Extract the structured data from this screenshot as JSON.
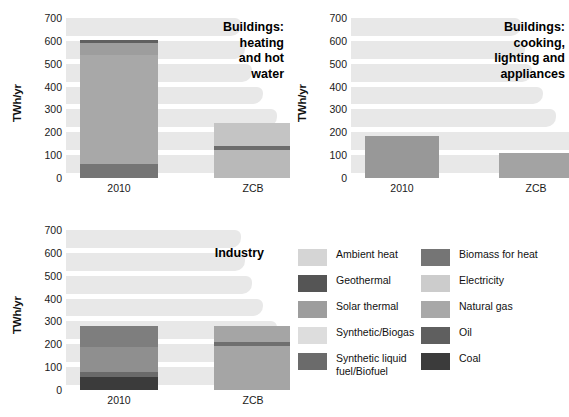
{
  "axis": {
    "ylabel": "TWh/yr",
    "yticks": [
      700,
      600,
      500,
      400,
      300,
      200,
      100,
      0
    ],
    "ymax": 700,
    "ymin": 0
  },
  "categories": [
    "2010",
    "ZCB"
  ],
  "legend": {
    "left": [
      {
        "label": "Ambient heat",
        "color": "#d5d5d5"
      },
      {
        "label": "Geothermal",
        "color": "#555555"
      },
      {
        "label": "Solar thermal",
        "color": "#9d9d9d"
      },
      {
        "label": "Synthetic/Biogas",
        "color": "#dddddd"
      },
      {
        "label": "Synthetic liquid\nfuel/Biofuel",
        "color": "#6b6b6b"
      }
    ],
    "right": [
      {
        "label": "Biomass for heat",
        "color": "#757575"
      },
      {
        "label": "Electricity",
        "color": "#cccccc"
      },
      {
        "label": "Natural gas",
        "color": "#a8a8a8"
      },
      {
        "label": "Oil",
        "color": "#5f5f5f"
      },
      {
        "label": "Coal",
        "color": "#3b3b3b"
      }
    ]
  },
  "chart_data": [
    {
      "type": "bar",
      "id": "buildings-heating",
      "title": "Buildings:\nheating\nand hot\nwater",
      "ylabel": "TWh/yr",
      "xlabel": "",
      "ylim": [
        0,
        700
      ],
      "categories": [
        "2010",
        "ZCB"
      ],
      "stacked": true,
      "grid": true,
      "legend_position": "external-bottom-right",
      "series": [
        {
          "name": "Natural gas",
          "color": "#a8a8a8",
          "values": [
            480,
            0
          ]
        },
        {
          "name": "Biomass for heat",
          "color": "#757575",
          "values": [
            60,
            0
          ]
        },
        {
          "name": "Oil",
          "color": "#5f5f5f",
          "values": [
            0,
            0
          ]
        },
        {
          "name": "Solar thermal",
          "color": "#9d9d9d",
          "values": [
            0,
            0
          ]
        },
        {
          "name": "Electricity",
          "color": "#cccccc",
          "values": [
            0,
            225
          ]
        },
        {
          "name": "Geothermal",
          "color": "#555555",
          "values": [
            0,
            15
          ]
        },
        {
          "name": "Ambient heat",
          "color": "#d5d5d5",
          "values": [
            0,
            0
          ]
        },
        {
          "name": "Coal",
          "color": "#3b3b3b",
          "values": [
            0,
            0
          ]
        }
      ],
      "stack_order_2010": [
        {
          "name": "Biomass for heat",
          "color": "#757575",
          "from": 0,
          "to": 60
        },
        {
          "name": "Natural gas",
          "color": "#a8a8a8",
          "from": 60,
          "to": 540
        },
        {
          "name": "Solar thermal",
          "color": "#9d9d9d",
          "from": 540,
          "to": 592
        },
        {
          "name": "Oil",
          "color": "#5f5f5f",
          "from": 592,
          "to": 604
        }
      ],
      "stack_order_zcb": [
        {
          "name": "Electricity",
          "color": "#b9b9b9",
          "from": 0,
          "to": 124
        },
        {
          "name": "Geothermal",
          "color": "#6d6d6d",
          "from": 124,
          "to": 138
        },
        {
          "name": "Ambient heat",
          "color": "#c4c4c4",
          "from": 138,
          "to": 240
        }
      ],
      "totals": [
        604,
        240
      ]
    },
    {
      "type": "bar",
      "id": "buildings-cooking",
      "title": "Buildings:\ncooking,\nlighting and\nappliances",
      "ylabel": "TWh/yr",
      "xlabel": "",
      "ylim": [
        0,
        700
      ],
      "categories": [
        "2010",
        "ZCB"
      ],
      "stacked": true,
      "grid": true,
      "stack_order_2010": [
        {
          "name": "Electricity",
          "color": "#989898",
          "from": 0,
          "to": 185
        }
      ],
      "stack_order_zcb": [
        {
          "name": "Electricity",
          "color": "#a3a3a3",
          "from": 0,
          "to": 110
        }
      ],
      "totals": [
        185,
        110
      ]
    },
    {
      "type": "bar",
      "id": "industry",
      "title": "Industry",
      "ylabel": "TWh/yr",
      "xlabel": "",
      "ylim": [
        0,
        700
      ],
      "categories": [
        "2010",
        "ZCB"
      ],
      "stacked": true,
      "grid": true,
      "stack_order_2010": [
        {
          "name": "Coal",
          "color": "#3b3b3b",
          "from": 0,
          "to": 55
        },
        {
          "name": "Oil",
          "color": "#6a6a6a",
          "from": 55,
          "to": 78
        },
        {
          "name": "Natural gas",
          "color": "#8f8f8f",
          "from": 78,
          "to": 190
        },
        {
          "name": "Electricity",
          "color": "#7e7e7e",
          "from": 190,
          "to": 282
        }
      ],
      "stack_order_zcb": [
        {
          "name": "Electricity",
          "color": "#a5a5a5",
          "from": 0,
          "to": 192
        },
        {
          "name": "Synthetic liquid fuel/Biofuel",
          "color": "#6f6f6f",
          "from": 192,
          "to": 212
        },
        {
          "name": "Synthetic/Biogas",
          "color": "#a5a5a5",
          "from": 212,
          "to": 278
        }
      ],
      "totals": [
        282,
        278
      ]
    }
  ]
}
